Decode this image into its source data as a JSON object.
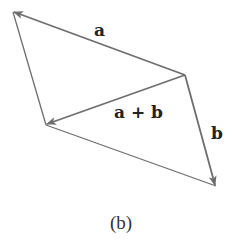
{
  "figure": {
    "caption": "(b)",
    "type": "vector parallelogram (vector addition)",
    "colors": {
      "line": "#6e6e6e",
      "text": "#222222",
      "background": "#ffffff"
    }
  },
  "points": {
    "P_topleft": [
      13,
      12
    ],
    "Q_right": [
      185,
      75
    ],
    "R_leftmid": [
      46,
      125
    ],
    "S_bottomright": [
      216,
      186
    ]
  },
  "vectors": [
    {
      "id": "a",
      "label": "a",
      "from": "Q_right",
      "to": "P_topleft",
      "arrow": true
    },
    {
      "id": "b",
      "label": "b",
      "from": "Q_right",
      "to": "S_bottomright",
      "arrow": true
    },
    {
      "id": "a_plus_b",
      "label": "a + b",
      "from": "Q_right",
      "to": "R_leftmid",
      "arrow": true
    }
  ],
  "edges": [
    {
      "id": "left-edge",
      "from": "P_topleft",
      "to": "R_leftmid",
      "arrow": false
    },
    {
      "id": "bottom-edge",
      "from": "R_leftmid",
      "to": "S_bottomright",
      "arrow": false
    }
  ],
  "labels": {
    "a": "a",
    "b": "b",
    "a_plus_b": "a + b"
  }
}
